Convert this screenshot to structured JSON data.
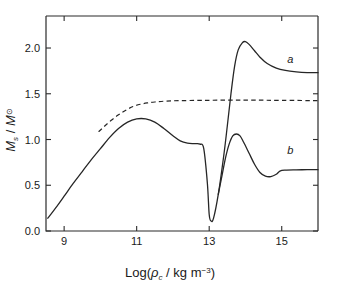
{
  "chart_data": {
    "type": "line",
    "title": "",
    "xlabel": "Log(ρc / kg m⁻³)",
    "xlabel_parts": {
      "prefix": "Log(",
      "rho": "ρ",
      "rho_sub": "c",
      "middle": " / kg m",
      "exponent": "−3",
      "suffix": ")"
    },
    "ylabel": "Ms / M⊙",
    "ylabel_parts": {
      "m": "M",
      "m_sub": "s",
      "slash": " / ",
      "m2": "M",
      "sun": "⊙"
    },
    "xlim": [
      8.5,
      16.0
    ],
    "ylim": [
      0.0,
      2.35
    ],
    "xticks": [
      9,
      11,
      13,
      15
    ],
    "xtick_labels": [
      "9",
      "11",
      "13",
      "15"
    ],
    "yticks": [
      0.0,
      0.5,
      1.0,
      1.5,
      2.0
    ],
    "ytick_labels": [
      "0.0",
      "0.5",
      "1.0",
      "1.5",
      "2.0"
    ],
    "grid": false,
    "legend_position": "inline-annotations",
    "series": [
      {
        "name": "a",
        "label": "a",
        "style": "solid",
        "annotation_x": 15.15,
        "annotation_y": 1.84,
        "points": [
          [
            8.55,
            0.14
          ],
          [
            8.8,
            0.27
          ],
          [
            9.0,
            0.38
          ],
          [
            9.25,
            0.52
          ],
          [
            9.5,
            0.65
          ],
          [
            9.75,
            0.78
          ],
          [
            10.0,
            0.9
          ],
          [
            10.25,
            1.02
          ],
          [
            10.5,
            1.12
          ],
          [
            10.75,
            1.19
          ],
          [
            11.0,
            1.225
          ],
          [
            11.25,
            1.225
          ],
          [
            11.5,
            1.19
          ],
          [
            11.75,
            1.12
          ],
          [
            12.0,
            1.04
          ],
          [
            12.2,
            0.985
          ],
          [
            12.4,
            0.96
          ],
          [
            12.6,
            0.955
          ],
          [
            12.75,
            0.95
          ],
          [
            12.85,
            0.9
          ],
          [
            12.95,
            0.52
          ],
          [
            13.0,
            0.18
          ],
          [
            13.05,
            0.11
          ],
          [
            13.12,
            0.14
          ],
          [
            13.25,
            0.4
          ],
          [
            13.4,
            0.82
          ],
          [
            13.5,
            1.15
          ],
          [
            13.6,
            1.5
          ],
          [
            13.7,
            1.8
          ],
          [
            13.8,
            1.98
          ],
          [
            13.92,
            2.06
          ],
          [
            14.0,
            2.07
          ],
          [
            14.1,
            2.04
          ],
          [
            14.25,
            1.97
          ],
          [
            14.4,
            1.9
          ],
          [
            14.6,
            1.83
          ],
          [
            14.85,
            1.78
          ],
          [
            15.1,
            1.755
          ],
          [
            15.4,
            1.74
          ],
          [
            15.7,
            1.732
          ],
          [
            16.0,
            1.73
          ]
        ]
      },
      {
        "name": "b",
        "label": "b",
        "style": "solid",
        "annotation_x": 15.15,
        "annotation_y": 0.84,
        "points": [
          [
            13.25,
            0.4
          ],
          [
            13.35,
            0.6
          ],
          [
            13.45,
            0.8
          ],
          [
            13.55,
            0.95
          ],
          [
            13.65,
            1.04
          ],
          [
            13.75,
            1.06
          ],
          [
            13.85,
            1.04
          ],
          [
            13.95,
            0.97
          ],
          [
            14.1,
            0.85
          ],
          [
            14.25,
            0.73
          ],
          [
            14.4,
            0.64
          ],
          [
            14.55,
            0.6
          ],
          [
            14.7,
            0.595
          ],
          [
            14.85,
            0.62
          ],
          [
            14.95,
            0.655
          ],
          [
            15.1,
            0.665
          ],
          [
            15.4,
            0.668
          ],
          [
            15.7,
            0.67
          ],
          [
            16.0,
            0.67
          ]
        ]
      },
      {
        "name": "newtonian-limit",
        "label": "",
        "style": "dashed",
        "points": [
          [
            9.95,
            1.085
          ],
          [
            10.1,
            1.14
          ],
          [
            10.3,
            1.21
          ],
          [
            10.5,
            1.27
          ],
          [
            10.7,
            1.32
          ],
          [
            10.9,
            1.36
          ],
          [
            11.1,
            1.385
          ],
          [
            11.3,
            1.4
          ],
          [
            11.5,
            1.41
          ],
          [
            11.8,
            1.42
          ],
          [
            12.2,
            1.425
          ],
          [
            12.8,
            1.428
          ],
          [
            13.5,
            1.43
          ],
          [
            14.2,
            1.43
          ],
          [
            15.0,
            1.428
          ],
          [
            16.0,
            1.425
          ]
        ]
      }
    ]
  },
  "axes": {
    "x_tick_count": 4,
    "y_tick_count": 5
  }
}
